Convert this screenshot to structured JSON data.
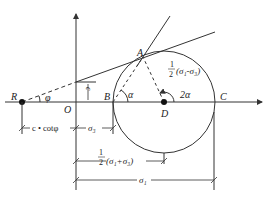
{
  "diagram": {
    "colors": {
      "stroke": "#333333",
      "background": "#ffffff",
      "point": "#111111"
    },
    "points": {
      "R": "R",
      "O": "O",
      "B": "B",
      "A": "A",
      "D": "D",
      "C": "C"
    },
    "angles": {
      "phi": "φ",
      "alpha": "α",
      "two_alpha": "2α"
    },
    "labels": {
      "cohesion": "c",
      "radius_frac_num": "1",
      "radius_frac_den": "2",
      "radius_expr": "(σ₁-σ₃)",
      "center_frac_num": "1",
      "center_frac_den": "2",
      "center_expr": "(σ₁+σ₃)",
      "sigma3": "σ₃",
      "sigma1": "σ₁",
      "c_cot_phi": "c • cotφ"
    }
  }
}
